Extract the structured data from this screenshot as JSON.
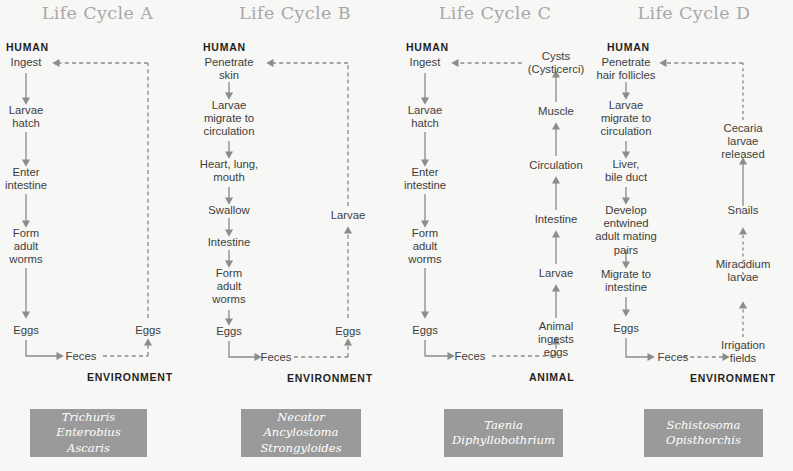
{
  "figure": {
    "background_color": "#f7f7f5",
    "accent_box_color": "#9a9a9a",
    "line_color": "#8c8c8c",
    "title_color": "#a8a8a8"
  },
  "columns": [
    {
      "id": "a",
      "title": "Life Cycle A",
      "host_label": "HUMAN",
      "env_label": "ENVIRONMENT",
      "human_chain": [
        "Ingest",
        "Larvae\nhatch",
        "Enter\nintestine",
        "Form\nadult\nworms",
        "Eggs"
      ],
      "excretion": "Feces",
      "external_chain": [
        "Eggs"
      ],
      "species": "Trichuris\nEnterobius\nAscaris"
    },
    {
      "id": "b",
      "title": "Life Cycle B",
      "host_label": "HUMAN",
      "env_label": "ENVIRONMENT",
      "human_chain": [
        "Penetrate\nskin",
        "Larvae\nmigrate to\ncirculation",
        "Heart, lung,\nmouth",
        "Swallow",
        "Intestine",
        "Form\nadult\nworms",
        "Eggs"
      ],
      "excretion": "Feces",
      "external_chain": [
        "Eggs",
        "Larvae"
      ],
      "species": "Necator\nAncylostoma\nStrongyloides"
    },
    {
      "id": "c",
      "title": "Life Cycle C",
      "host_label": "HUMAN",
      "env_label": "ANIMAL",
      "human_chain": [
        "Ingest",
        "Larvae\nhatch",
        "Enter\nintestine",
        "Form\nadult\nworms",
        "Eggs"
      ],
      "excretion": "Feces",
      "external_chain": [
        "Animal\ningests eggs",
        "Larvae",
        "Intestine",
        "Circulation",
        "Muscle",
        "Cysts\n(Cysticerci)"
      ],
      "species": "Taenia\nDiphyllobothrium"
    },
    {
      "id": "d",
      "title": "Life Cycle D",
      "host_label": "HUMAN",
      "env_label": "ENVIRONMENT",
      "human_chain": [
        "Penetrate\nhair follicles",
        "Larvae\nmigrate to\ncirculation",
        "Liver,\nbile duct",
        "Develop\nentwined\nadult mating\npairs",
        "Migrate to\nintestine",
        "Eggs"
      ],
      "excretion": "Feces",
      "external_chain": [
        "Irrigation\nfields",
        "Miracidium\nlarvae",
        "Snails",
        "Cecaria\nlarvae\nreleased"
      ],
      "species": "Schistosoma\nOpisthorchis"
    }
  ]
}
